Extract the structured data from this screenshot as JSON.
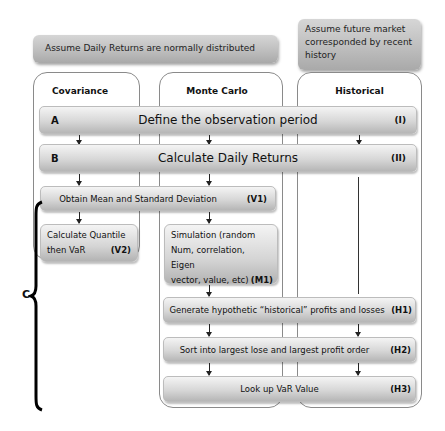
{
  "assumptions": {
    "parametric": "Assume Daily Returns are normally distributed",
    "historical": "Assume future market corresponded by recent history"
  },
  "columns": [
    {
      "id": "covariance",
      "title": "Covariance"
    },
    {
      "id": "monte_carlo",
      "title": "Monte Carlo"
    },
    {
      "id": "historical",
      "title": "Historical"
    }
  ],
  "steps": {
    "A": {
      "letter": "A",
      "label": "Define the observation period",
      "code": "(I)"
    },
    "B": {
      "letter": "B",
      "label": "Calculate Daily Returns",
      "code": "(II)"
    },
    "V1": {
      "label": "Obtain Mean and Standard Deviation",
      "code": "(V1)"
    },
    "V2": {
      "line1": "Calculate Quantile",
      "line2": "then VaR",
      "code": "(V2)"
    },
    "M1": {
      "line1": "Simulation (random",
      "line2": "Num, correlation, Eigen",
      "line3": "vector, value, etc)",
      "code": "(M1)"
    },
    "H1": {
      "label": "Generate hypothetic “historical” profits and losses",
      "code": "(H1)"
    },
    "H2": {
      "label": "Sort into largest lose and largest profit order",
      "code": "(H2)"
    },
    "H3": {
      "label": "Look up VaR Value",
      "code": "(H3)"
    }
  },
  "brace": {
    "label": "C"
  }
}
